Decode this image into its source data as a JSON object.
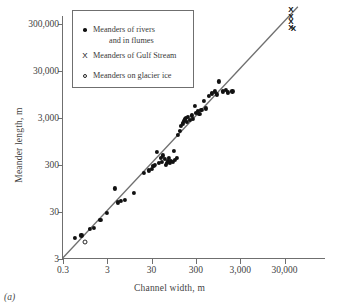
{
  "chart_data": {
    "type": "scatter",
    "title": "",
    "xlabel": "Channel width, m",
    "ylabel": "Meander length, m",
    "caption": "(a)",
    "xscale": "log",
    "yscale": "log",
    "xlim": [
      0.3,
      300000
    ],
    "ylim": [
      3,
      1000000
    ],
    "grid": false,
    "legend_position": "top-left",
    "xticks": [
      "0.3",
      "3",
      "30",
      "300",
      "3,000",
      "30,000"
    ],
    "xtick_values": [
      0.3,
      3,
      30,
      300,
      3000,
      30000
    ],
    "yticks": [
      "3",
      "30",
      "300",
      "3,000",
      "30,000",
      "300,000"
    ],
    "ytick_values": [
      3,
      30,
      300,
      3000,
      30000,
      300000
    ],
    "trendline": {
      "label": "",
      "x": [
        0.3,
        60000
      ],
      "y": [
        3.2,
        700000
      ],
      "color": "#6f6f6f"
    },
    "legend": [
      {
        "marker": "dot",
        "label": "Meanders of rivers",
        "label2": "and in flumes"
      },
      {
        "marker": "x",
        "label": "Meanders of Gulf Stream",
        "label2": ""
      },
      {
        "marker": "circle",
        "label": "Meanders on glacier ice",
        "label2": ""
      }
    ],
    "series": [
      {
        "name": "Meanders of rivers and in flumes",
        "marker": "dot",
        "color": "#111111",
        "points": [
          [
            0.55,
            8.5
          ],
          [
            0.78,
            9.5
          ],
          [
            1.2,
            13
          ],
          [
            1.5,
            14
          ],
          [
            2.1,
            20
          ],
          [
            3.0,
            29
          ],
          [
            4.5,
            95
          ],
          [
            5.2,
            48
          ],
          [
            6.0,
            52
          ],
          [
            7.5,
            55
          ],
          [
            12.0,
            75
          ],
          [
            20.0,
            200
          ],
          [
            26.0,
            230
          ],
          [
            30.0,
            250
          ],
          [
            33.0,
            290
          ],
          [
            36.0,
            300
          ],
          [
            40.0,
            560
          ],
          [
            44.0,
            330
          ],
          [
            48.0,
            420
          ],
          [
            52.0,
            350
          ],
          [
            55.0,
            480
          ],
          [
            60.0,
            400
          ],
          [
            62.0,
            300
          ],
          [
            66.0,
            330
          ],
          [
            70.0,
            360
          ],
          [
            74.0,
            420
          ],
          [
            78.0,
            330
          ],
          [
            82.0,
            370
          ],
          [
            90.0,
            350
          ],
          [
            95.0,
            600
          ],
          [
            100.0,
            390
          ],
          [
            110.0,
            420
          ],
          [
            120.0,
            1300
          ],
          [
            130.0,
            1600
          ],
          [
            140.0,
            2000
          ],
          [
            150.0,
            2300
          ],
          [
            160.0,
            2600
          ],
          [
            170.0,
            2800
          ],
          [
            180.0,
            3000
          ],
          [
            190.0,
            2500
          ],
          [
            200.0,
            3200
          ],
          [
            220.0,
            2700
          ],
          [
            240.0,
            3400
          ],
          [
            260.0,
            2900
          ],
          [
            280.0,
            5500
          ],
          [
            300.0,
            3900
          ],
          [
            330.0,
            4200
          ],
          [
            360.0,
            3600
          ],
          [
            400.0,
            4500
          ],
          [
            450.0,
            7000
          ],
          [
            500.0,
            4800
          ],
          [
            600.0,
            9000
          ],
          [
            700.0,
            10000
          ],
          [
            800.0,
            11000
          ],
          [
            900.0,
            9500
          ],
          [
            1000.0,
            18000
          ],
          [
            1200.0,
            11000
          ],
          [
            1400.0,
            12000
          ],
          [
            1600.0,
            10500
          ],
          [
            2000.0,
            11000
          ]
        ]
      },
      {
        "name": "Meanders of Gulf Stream",
        "marker": "x",
        "color": "#111111",
        "points": [
          [
            42000,
            600000
          ],
          [
            42000,
            430000
          ],
          [
            42000,
            330000
          ],
          [
            42000,
            250000
          ],
          [
            48000,
            240000
          ]
        ]
      },
      {
        "name": "Meanders on glacier ice",
        "marker": "circle",
        "color": "#111111",
        "points": [
          [
            0.95,
            7.0
          ]
        ]
      }
    ]
  }
}
